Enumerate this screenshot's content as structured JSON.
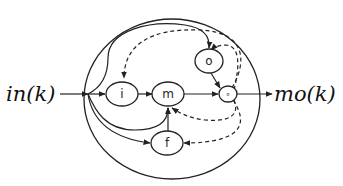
{
  "diagram": {
    "input_label": "in(k)",
    "output_label": "mo(k)",
    "nodes": {
      "input_gate": "i",
      "memory": "m",
      "output_gate": "o",
      "product": "∘",
      "forget_gate": "f"
    },
    "edges_solid": [
      "in(k) -> i",
      "in(k) -> m",
      "in(k) -> f",
      "in(k) -> o",
      "i -> m",
      "m -> ∘",
      "o -> ∘",
      "f -> m",
      "∘ -> mo(k)"
    ],
    "edges_dashed": [
      "∘ -> i",
      "∘ -> o",
      "∘ -> m",
      "∘ -> f"
    ]
  }
}
